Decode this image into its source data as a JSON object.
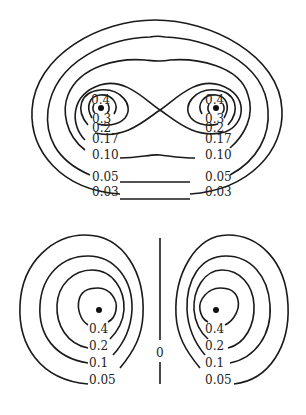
{
  "top_diagram": {
    "description": "Contour plot with two charge centers enclosed by figure-eight separatrix",
    "left_labels": [
      "0.4",
      "0.3",
      "0.2",
      "0.17",
      "0.10",
      "0.05",
      "0.03"
    ],
    "right_labels": [
      "0.4",
      "0.3",
      "0.2",
      "0.17",
      "0.10",
      "0.05",
      "0.03"
    ]
  },
  "bottom_diagram": {
    "description": "Two separate contour families with zero line between",
    "left_labels": [
      "0.4",
      "0.2",
      "0.1",
      "0.05"
    ],
    "right_labels": [
      "0.4",
      "0.2",
      "0.1",
      "0.05"
    ],
    "center_label": "0"
  },
  "colors": {
    "line": "#1a1a1a",
    "background": "#ffffff"
  }
}
